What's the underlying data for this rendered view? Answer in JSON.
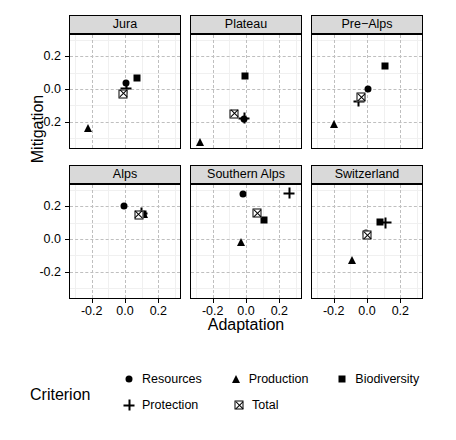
{
  "chart_data": {
    "type": "scatter",
    "title": "",
    "xlabel": "Adaptation",
    "ylabel": "Mitigation",
    "xlim": [
      -0.33,
      0.33
    ],
    "ylim": [
      -0.36,
      0.33
    ],
    "xticks": [
      "-0.2",
      "0.0",
      "0.2"
    ],
    "xtick_values": [
      -0.2,
      0.0,
      0.2
    ],
    "yticks": [
      "0.2",
      "0.0",
      "-0.2"
    ],
    "ytick_values": [
      0.2,
      0.0,
      -0.2
    ],
    "grid": true,
    "legend_position": "bottom",
    "legend_title": "Criterion",
    "facet_layout": {
      "rows": 2,
      "cols": 3
    },
    "facets": [
      {
        "label": "Jura",
        "points": [
          {
            "series": "Resources",
            "x": 0.005,
            "y": 0.035
          },
          {
            "series": "Production",
            "x": -0.225,
            "y": -0.235
          },
          {
            "series": "Biodiversity",
            "x": 0.072,
            "y": 0.07
          },
          {
            "series": "Protection",
            "x": 0.008,
            "y": 0.005
          },
          {
            "series": "Total",
            "x": -0.012,
            "y": -0.03
          }
        ]
      },
      {
        "label": "Plateau",
        "points": [
          {
            "series": "Resources",
            "x": -0.01,
            "y": -0.18
          },
          {
            "series": "Production",
            "x": -0.275,
            "y": -0.325
          },
          {
            "series": "Biodiversity",
            "x": -0.005,
            "y": 0.08
          },
          {
            "series": "Protection",
            "x": -0.012,
            "y": -0.178
          },
          {
            "series": "Total",
            "x": -0.072,
            "y": -0.15
          }
        ]
      },
      {
        "label": "Pre−Alps",
        "points": [
          {
            "series": "Resources",
            "x": 0.005,
            "y": 0.0
          },
          {
            "series": "Production",
            "x": -0.2,
            "y": -0.215
          },
          {
            "series": "Biodiversity",
            "x": 0.11,
            "y": 0.14
          },
          {
            "series": "Protection",
            "x": -0.05,
            "y": -0.075
          },
          {
            "series": "Total",
            "x": -0.035,
            "y": -0.05
          }
        ]
      },
      {
        "label": "Alps",
        "points": [
          {
            "series": "Resources",
            "x": -0.005,
            "y": 0.2
          },
          {
            "series": "Production",
            "x": 0.112,
            "y": 0.15
          },
          {
            "series": "Biodiversity",
            "x": 0.105,
            "y": 0.152
          },
          {
            "series": "Protection",
            "x": 0.1,
            "y": 0.158
          },
          {
            "series": "Total",
            "x": 0.082,
            "y": 0.148
          }
        ]
      },
      {
        "label": "Southern Alps",
        "points": [
          {
            "series": "Resources",
            "x": -0.018,
            "y": 0.272
          },
          {
            "series": "Production",
            "x": -0.03,
            "y": -0.02
          },
          {
            "series": "Biodiversity",
            "x": 0.105,
            "y": 0.118
          },
          {
            "series": "Protection",
            "x": 0.258,
            "y": 0.28
          },
          {
            "series": "Total",
            "x": 0.068,
            "y": 0.158
          }
        ]
      },
      {
        "label": "Switzerland",
        "points": [
          {
            "series": "Resources",
            "x": -0.008,
            "y": 0.035
          },
          {
            "series": "Production",
            "x": -0.09,
            "y": -0.128
          },
          {
            "series": "Biodiversity",
            "x": 0.078,
            "y": 0.102
          },
          {
            "series": "Protection",
            "x": 0.112,
            "y": 0.098
          },
          {
            "series": "Total",
            "x": 0.002,
            "y": 0.022
          }
        ]
      }
    ],
    "series": [
      {
        "name": "Resources",
        "marker": "circle",
        "color": "#000000"
      },
      {
        "name": "Production",
        "marker": "triangle",
        "color": "#000000"
      },
      {
        "name": "Biodiversity",
        "marker": "square",
        "color": "#000000"
      },
      {
        "name": "Protection",
        "marker": "plus",
        "color": "#000000"
      },
      {
        "name": "Total",
        "marker": "squarex",
        "color": "#000000"
      }
    ]
  },
  "legend": {
    "title": "Criterion",
    "rows": [
      [
        {
          "label": "Resources",
          "marker": "circle"
        },
        {
          "label": "Production",
          "marker": "triangle"
        },
        {
          "label": "Biodiversity",
          "marker": "square"
        }
      ],
      [
        {
          "label": "Protection",
          "marker": "plus"
        },
        {
          "label": "Total",
          "marker": "squarex"
        }
      ]
    ]
  },
  "style": {
    "strip_background": "#d9d9d9",
    "panel_background": "#ffffff",
    "grid_major_color": "#bfbfbf",
    "grid_minor_color": "#f0f0f0",
    "border_color": "#000000",
    "marker_color": "#000000"
  }
}
